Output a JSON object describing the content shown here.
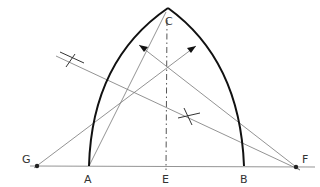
{
  "diagram": {
    "type": "geometric-construction",
    "points": {
      "A": {
        "label": "A",
        "x": 89,
        "y": 166
      },
      "B": {
        "label": "B",
        "x": 244,
        "y": 166
      },
      "C": {
        "label": "C",
        "x": 168,
        "y": 8
      },
      "E": {
        "label": "E",
        "x": 166,
        "y": 166
      },
      "F": {
        "label": "F",
        "x": 296,
        "y": 167
      },
      "G": {
        "label": "G",
        "x": 37,
        "y": 166
      }
    },
    "labels": [
      "C",
      "G",
      "A",
      "E",
      "B",
      "F"
    ],
    "colors": {
      "arc": "#111111",
      "construction": "#777777",
      "text": "#333333"
    }
  }
}
